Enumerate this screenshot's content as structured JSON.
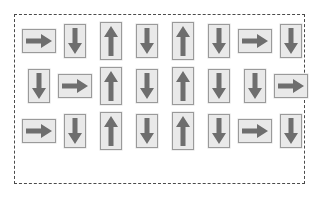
{
  "canvas": {
    "width": 319,
    "height": 198,
    "background_color": "#ffffff"
  },
  "container": {
    "name": "dashed-selection-box",
    "border_style": "dashed",
    "border_color": "#4a4a4a",
    "left": 14,
    "top": 14,
    "width": 291,
    "height": 170
  },
  "card_style": {
    "face_color": "#e9e9e9",
    "border_color": "#9a9a9a",
    "arrow_color": "#6e6e6e",
    "horizontal_size": "34x24",
    "vertical_down_size": "22x34",
    "vertical_up_size": "22x38"
  },
  "grid": {
    "rows": 3,
    "columns": 8,
    "total_cards": 24,
    "cards": [
      [
        {
          "direction": "right",
          "label": "right-arrow"
        },
        {
          "direction": "down",
          "label": "down-arrow"
        },
        {
          "direction": "up",
          "label": "up-arrow"
        },
        {
          "direction": "down",
          "label": "down-arrow"
        },
        {
          "direction": "up",
          "label": "up-arrow"
        },
        {
          "direction": "down",
          "label": "down-arrow"
        },
        {
          "direction": "right",
          "label": "right-arrow"
        },
        {
          "direction": "down",
          "label": "down-arrow"
        }
      ],
      [
        {
          "direction": "down",
          "label": "down-arrow"
        },
        {
          "direction": "right",
          "label": "right-arrow"
        },
        {
          "direction": "up",
          "label": "up-arrow"
        },
        {
          "direction": "down",
          "label": "down-arrow"
        },
        {
          "direction": "up",
          "label": "up-arrow"
        },
        {
          "direction": "down",
          "label": "down-arrow"
        },
        {
          "direction": "down",
          "label": "down-arrow"
        },
        {
          "direction": "right",
          "label": "right-arrow"
        }
      ],
      [
        {
          "direction": "right",
          "label": "right-arrow"
        },
        {
          "direction": "down",
          "label": "down-arrow"
        },
        {
          "direction": "up",
          "label": "up-arrow"
        },
        {
          "direction": "down",
          "label": "down-arrow"
        },
        {
          "direction": "up",
          "label": "up-arrow"
        },
        {
          "direction": "down",
          "label": "down-arrow"
        },
        {
          "direction": "right",
          "label": "right-arrow"
        },
        {
          "direction": "down",
          "label": "down-arrow"
        }
      ]
    ]
  }
}
